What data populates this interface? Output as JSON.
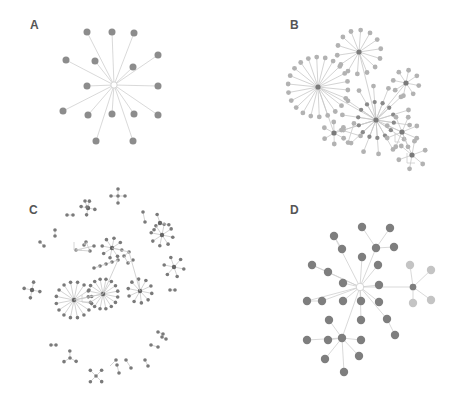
{
  "figure": {
    "panels": [
      {
        "label": "A",
        "label_pos": [
          30,
          24
        ],
        "node_color": "#8c8c8c",
        "node_r": 3.5,
        "nodes": [
          [
            114,
            85,
            "hub"
          ],
          [
            87,
            32
          ],
          [
            112,
            32
          ],
          [
            134,
            33
          ],
          [
            66,
            60
          ],
          [
            95,
            61
          ],
          [
            133,
            67
          ],
          [
            158,
            55
          ],
          [
            87,
            86
          ],
          [
            158,
            86
          ],
          [
            63,
            111
          ],
          [
            88,
            115
          ],
          [
            112,
            114
          ],
          [
            134,
            114
          ],
          [
            158,
            115
          ],
          [
            96,
            141
          ],
          [
            133,
            141
          ]
        ],
        "edges": [
          [
            0,
            1
          ],
          [
            0,
            2
          ],
          [
            0,
            3
          ],
          [
            0,
            4
          ],
          [
            0,
            5
          ],
          [
            0,
            6
          ],
          [
            0,
            7
          ],
          [
            0,
            8
          ],
          [
            0,
            9
          ],
          [
            0,
            10
          ],
          [
            0,
            11
          ],
          [
            0,
            12
          ],
          [
            0,
            13
          ],
          [
            0,
            14
          ],
          [
            0,
            15
          ],
          [
            0,
            16
          ]
        ]
      },
      {
        "label": "B",
        "label_pos": [
          290,
          24
        ],
        "node_color": "#a8a8a8",
        "node_r": 2.6
      },
      {
        "label": "C",
        "label_pos": [
          29,
          210
        ],
        "node_color": "#7a7a7a",
        "node_r": 2.0
      },
      {
        "label": "D",
        "label_pos": [
          290,
          210
        ],
        "node_color": "#7e7e7e",
        "node_r": 4.2,
        "nodes": [
          [
            360,
            287,
            "hub"
          ],
          [
            362,
            227
          ],
          [
            390,
            228
          ],
          [
            334,
            236
          ],
          [
            342,
            249
          ],
          [
            376,
            248
          ],
          [
            394,
            247
          ],
          [
            362,
            257
          ],
          [
            378,
            265
          ],
          [
            312,
            265
          ],
          [
            328,
            272
          ],
          [
            343,
            283
          ],
          [
            379,
            285
          ],
          [
            307,
            301
          ],
          [
            322,
            301
          ],
          [
            343,
            301
          ],
          [
            361,
            301
          ],
          [
            379,
            302
          ],
          [
            361,
            320
          ],
          [
            387,
            319
          ],
          [
            395,
            335
          ],
          [
            329,
            320
          ],
          [
            342,
            338
          ],
          [
            307,
            340
          ],
          [
            328,
            340
          ],
          [
            361,
            340
          ],
          [
            325,
            359
          ],
          [
            359,
            356
          ],
          [
            344,
            372
          ],
          [
            413,
            287,
            "sub"
          ],
          [
            410,
            265,
            "light"
          ],
          [
            431,
            270,
            "light"
          ],
          [
            413,
            303,
            "light"
          ],
          [
            431,
            300,
            "light"
          ]
        ],
        "edges": [
          [
            0,
            5
          ],
          [
            5,
            1
          ],
          [
            5,
            2
          ],
          [
            5,
            6
          ],
          [
            0,
            3
          ],
          [
            3,
            4
          ],
          [
            0,
            7
          ],
          [
            0,
            8
          ],
          [
            0,
            9
          ],
          [
            9,
            10
          ],
          [
            10,
            0
          ],
          [
            0,
            11
          ],
          [
            0,
            12
          ],
          [
            0,
            13
          ],
          [
            13,
            14
          ],
          [
            14,
            0
          ],
          [
            0,
            15
          ],
          [
            0,
            16
          ],
          [
            0,
            17
          ],
          [
            0,
            18
          ],
          [
            0,
            19
          ],
          [
            19,
            20
          ],
          [
            0,
            22
          ],
          [
            22,
            21
          ],
          [
            22,
            23
          ],
          [
            22,
            24
          ],
          [
            22,
            25
          ],
          [
            22,
            26
          ],
          [
            22,
            27
          ],
          [
            22,
            28
          ],
          [
            0,
            29
          ],
          [
            29,
            30
          ],
          [
            29,
            31
          ],
          [
            29,
            32
          ],
          [
            29,
            33
          ]
        ]
      }
    ]
  }
}
